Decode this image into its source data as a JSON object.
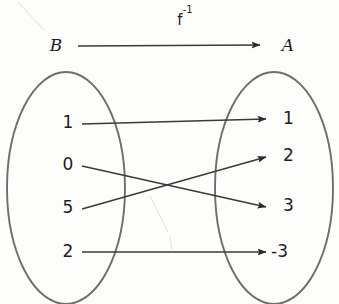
{
  "diagram": {
    "function_label": "f",
    "function_exponent": "-1",
    "domain_set_name": "B",
    "codomain_set_name": "A",
    "domain_elements": [
      {
        "label": "1",
        "x": 68,
        "y": 123
      },
      {
        "label": "0",
        "x": 68,
        "y": 165
      },
      {
        "label": "5",
        "x": 68,
        "y": 208
      },
      {
        "label": "2",
        "x": 68,
        "y": 252
      }
    ],
    "codomain_elements": [
      {
        "label": "1",
        "x": 283,
        "y": 119
      },
      {
        "label": "2",
        "x": 283,
        "y": 156
      },
      {
        "label": "3",
        "x": 283,
        "y": 206
      },
      {
        "label": "-3",
        "x": 283,
        "y": 252
      }
    ],
    "mappings": [
      {
        "from": "1",
        "to": "1",
        "x1": 82,
        "y1": 124,
        "x2": 268,
        "y2": 119
      },
      {
        "from": "0",
        "to": "3",
        "x1": 82,
        "y1": 166,
        "x2": 268,
        "y2": 207
      },
      {
        "from": "5",
        "to": "2",
        "x1": 82,
        "y1": 209,
        "x2": 268,
        "y2": 157
      },
      {
        "from": "2",
        "to": "-3",
        "x1": 82,
        "y1": 252,
        "x2": 268,
        "y2": 252
      }
    ],
    "header_arrow": {
      "x1": 78,
      "y1": 46,
      "x2": 262,
      "y2": 45
    },
    "left_oval": {
      "cx": 66,
      "cy": 188,
      "rx": 59,
      "ry": 116
    },
    "right_oval": {
      "cx": 274,
      "cy": 188,
      "rx": 59,
      "ry": 116
    },
    "colors": {
      "oval_stroke": "#6e6e6e",
      "line_stroke": "#3a3a3a",
      "text": "#1c1c1c",
      "background": "#fdfdfc"
    }
  }
}
